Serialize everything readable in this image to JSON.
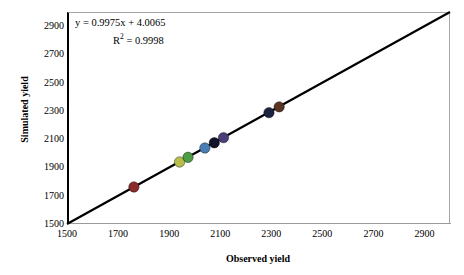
{
  "chart_data": {
    "type": "scatter",
    "title": "",
    "xlabel": "Observed yield",
    "ylabel": "Simulated yield",
    "xlim": [
      1500,
      3000
    ],
    "ylim": [
      1500,
      3000
    ],
    "xticks": [
      1500,
      1700,
      1900,
      2100,
      2300,
      2500,
      2700,
      2900
    ],
    "yticks": [
      1500,
      1700,
      1900,
      2100,
      2300,
      2500,
      2700,
      2900
    ],
    "grid": false,
    "legend": "none",
    "annotations": {
      "equation": "y = 0.9975x + 4.0065",
      "r_squared_label": "R",
      "r_squared_exp": "2",
      "r_squared_value": " = 0.9998",
      "r_squared_full": "R² = 0.9998"
    },
    "fit_line": {
      "slope": 0.9975,
      "intercept": 4.0065,
      "r2": 0.9998,
      "color": "#000000",
      "from": [
        1500,
        1500
      ],
      "to": [
        3000,
        3000
      ]
    },
    "points": [
      {
        "x": 1762,
        "y": 1762,
        "color": "#8c2b2b"
      },
      {
        "x": 1941,
        "y": 1939,
        "color": "#b7bf4a"
      },
      {
        "x": 1974,
        "y": 1972,
        "color": "#4f9b46"
      },
      {
        "x": 2040,
        "y": 2038,
        "color": "#4a7fb5"
      },
      {
        "x": 2077,
        "y": 2075,
        "color": "#12142c"
      },
      {
        "x": 2113,
        "y": 2111,
        "color": "#4a3d78"
      },
      {
        "x": 2291,
        "y": 2288,
        "color": "#1b2340"
      },
      {
        "x": 2331,
        "y": 2329,
        "color": "#5a3323"
      }
    ]
  }
}
